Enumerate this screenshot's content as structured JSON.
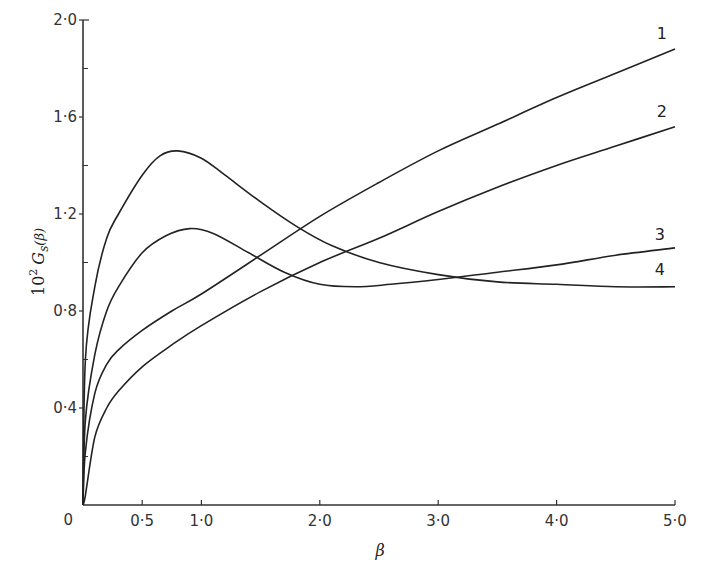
{
  "chart_data": {
    "type": "line",
    "title": "",
    "xlabel": "β",
    "ylabel": "10² G_s(β)",
    "ylabel_parts": {
      "prefix": "10",
      "sup": "2",
      "main": "G",
      "sub": "s",
      "arg": "(β)"
    },
    "xlim": [
      0,
      5.0
    ],
    "ylim": [
      0,
      2.0
    ],
    "grid": false,
    "legend_position": "inline labels at right end of curves",
    "x_ticks": [
      0,
      0.5,
      1.0,
      2.0,
      3.0,
      4.0,
      5.0
    ],
    "x_tick_labels": [
      "0",
      "0·5",
      "1·0",
      "2·0",
      "3·0",
      "4·0",
      "5·0"
    ],
    "y_ticks": [
      0,
      0.4,
      0.8,
      1.2,
      1.6,
      2.0
    ],
    "y_tick_labels": [
      "0",
      "0·4",
      "0·8",
      "1·2",
      "1·6",
      "2·0"
    ],
    "y_minor_ticks": [
      0.2,
      0.6,
      1.0,
      1.4,
      1.8
    ],
    "series": [
      {
        "name": "1",
        "x": [
          0.02,
          0.1,
          0.2,
          0.3,
          0.5,
          0.75,
          1.0,
          1.5,
          2.0,
          2.5,
          3.0,
          3.5,
          4.0,
          4.5,
          5.0
        ],
        "values": [
          0.22,
          0.46,
          0.58,
          0.64,
          0.72,
          0.8,
          0.87,
          1.03,
          1.19,
          1.33,
          1.46,
          1.57,
          1.68,
          1.78,
          1.88
        ]
      },
      {
        "name": "2",
        "x": [
          0.02,
          0.1,
          0.2,
          0.3,
          0.5,
          0.75,
          1.0,
          1.5,
          2.0,
          2.5,
          3.0,
          3.5,
          4.0,
          4.5,
          5.0
        ],
        "values": [
          0.04,
          0.28,
          0.4,
          0.47,
          0.57,
          0.66,
          0.74,
          0.88,
          1.0,
          1.1,
          1.21,
          1.31,
          1.4,
          1.48,
          1.56
        ]
      },
      {
        "name": "3",
        "x": [
          0.02,
          0.1,
          0.2,
          0.3,
          0.5,
          0.7,
          0.9,
          1.1,
          1.4,
          1.7,
          2.0,
          2.3,
          2.6,
          3.0,
          3.5,
          4.0,
          4.5,
          5.0
        ],
        "values": [
          0.35,
          0.62,
          0.8,
          0.9,
          1.04,
          1.11,
          1.14,
          1.12,
          1.04,
          0.96,
          0.91,
          0.9,
          0.91,
          0.93,
          0.96,
          0.99,
          1.03,
          1.06
        ]
      },
      {
        "name": "4",
        "x": [
          0.02,
          0.1,
          0.2,
          0.3,
          0.5,
          0.65,
          0.8,
          1.0,
          1.2,
          1.5,
          1.8,
          2.1,
          2.5,
          3.0,
          3.5,
          4.0,
          4.5,
          5.0
        ],
        "values": [
          0.6,
          0.9,
          1.1,
          1.2,
          1.36,
          1.44,
          1.46,
          1.43,
          1.36,
          1.25,
          1.15,
          1.07,
          1.0,
          0.95,
          0.92,
          0.91,
          0.9,
          0.9
        ]
      }
    ]
  },
  "layout": {
    "plot_left_px": 83,
    "plot_right_px": 675,
    "plot_top_px": 20,
    "plot_bottom_px": 505,
    "line_color": "#222222",
    "axis_color": "#333333"
  }
}
